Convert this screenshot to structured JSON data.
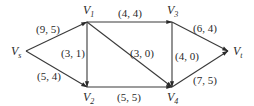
{
  "diagram": {
    "type": "network-flow",
    "nodes": [
      {
        "id": "Vs",
        "main": "V",
        "sub": "s",
        "x": 26,
        "y": 51,
        "lx": 11,
        "ly": 55
      },
      {
        "id": "V1",
        "main": "V",
        "sub": "1",
        "x": 87,
        "y": 22,
        "lx": 83,
        "ly": 14
      },
      {
        "id": "V2",
        "main": "V",
        "sub": "2",
        "x": 87,
        "y": 87,
        "lx": 83,
        "ly": 101
      },
      {
        "id": "V3",
        "main": "V",
        "sub": "3",
        "x": 172,
        "y": 22,
        "lx": 167,
        "ly": 14
      },
      {
        "id": "V4",
        "main": "V",
        "sub": "4",
        "x": 172,
        "y": 87,
        "lx": 167,
        "ly": 101
      },
      {
        "id": "Vt",
        "main": "V",
        "sub": "t",
        "x": 228,
        "y": 51,
        "lx": 233,
        "ly": 55
      }
    ],
    "edges": [
      {
        "from": "Vs",
        "to": "V1",
        "label": "(9, 5)",
        "lx": 36,
        "ly": 33
      },
      {
        "from": "Vs",
        "to": "V2",
        "label": "(5, 4)",
        "lx": 37,
        "ly": 80
      },
      {
        "from": "V1",
        "to": "V3",
        "label": "(4, 4)",
        "lx": 118,
        "ly": 17
      },
      {
        "from": "V1",
        "to": "V2",
        "label": "(3, 1)",
        "lx": 61,
        "ly": 57
      },
      {
        "from": "V1",
        "to": "V4",
        "label": "(3, 0)",
        "lx": 130,
        "ly": 57
      },
      {
        "from": "V2",
        "to": "V4",
        "label": "(5, 5)",
        "lx": 117,
        "ly": 101
      },
      {
        "from": "V3",
        "to": "V4",
        "label": "(4, 0)",
        "lx": 175,
        "ly": 60
      },
      {
        "from": "V3",
        "to": "Vt",
        "label": "(6, 4)",
        "lx": 193,
        "ly": 32
      },
      {
        "from": "V4",
        "to": "Vt",
        "label": "(7, 5)",
        "lx": 193,
        "ly": 84
      }
    ]
  },
  "colors": {
    "line": "#3a3a3a",
    "text": "#2a2a2a",
    "background": "#ffffff"
  }
}
